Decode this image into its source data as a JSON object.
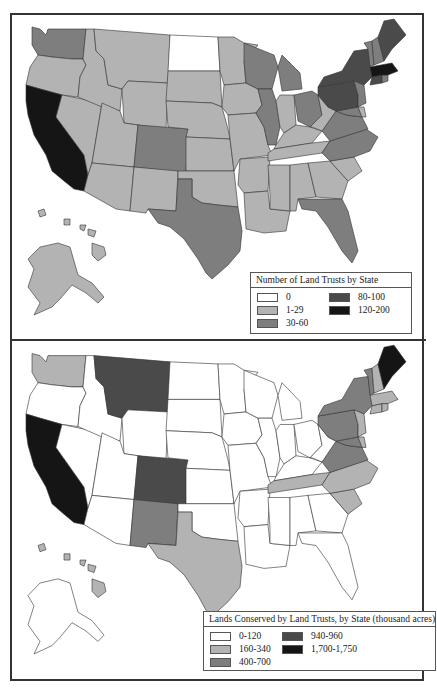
{
  "chart_data": [
    {
      "type": "choropleth",
      "title": "Number of Land Trusts by State",
      "legend_position": "lower-right",
      "classes": [
        {
          "key": "c0",
          "label": "0",
          "color": "#ffffff"
        },
        {
          "key": "c1",
          "label": "1-29",
          "color": "#b3b3b3"
        },
        {
          "key": "c2",
          "label": "30-60",
          "color": "#7e7e7e"
        },
        {
          "key": "c3",
          "label": "80-100",
          "color": "#4a4a4a"
        },
        {
          "key": "c4",
          "label": "120-200",
          "color": "#151515"
        }
      ],
      "states": {
        "WA": "c2",
        "OR": "c1",
        "CA": "c4",
        "NV": "c1",
        "ID": "c1",
        "MT": "c1",
        "WY": "c1",
        "UT": "c1",
        "AZ": "c1",
        "CO": "c2",
        "NM": "c1",
        "ND": "c0",
        "SD": "c1",
        "NE": "c1",
        "KS": "c1",
        "OK": "c1",
        "TX": "c2",
        "MN": "c1",
        "IA": "c1",
        "MO": "c1",
        "AR": "c1",
        "LA": "c1",
        "WI": "c2",
        "IL": "c2",
        "MI": "c2",
        "IN": "c1",
        "OH": "c2",
        "KY": "c1",
        "TN": "c1",
        "MS": "c1",
        "AL": "c1",
        "GA": "c1",
        "FL": "c2",
        "SC": "c1",
        "NC": "c2",
        "VA": "c2",
        "WV": "c1",
        "MD": "c2",
        "DE": "c1",
        "PA": "c3",
        "NY": "c3",
        "NJ": "c2",
        "CT": "c3",
        "RI": "c2",
        "MA": "c4",
        "VT": "c2",
        "NH": "c2",
        "ME": "c3",
        "AK": "c1",
        "HI": "c1"
      }
    },
    {
      "type": "choropleth",
      "title": "Lands Conserved by Land Trusts, by State (thousand acres)",
      "legend_position": "lower-right",
      "classes": [
        {
          "key": "c0",
          "label": "0-120",
          "color": "#ffffff"
        },
        {
          "key": "c1",
          "label": "160-340",
          "color": "#b3b3b3"
        },
        {
          "key": "c2",
          "label": "400-700",
          "color": "#7e7e7e"
        },
        {
          "key": "c3",
          "label": "940-960",
          "color": "#4a4a4a"
        },
        {
          "key": "c4",
          "label": "1,700-1,750",
          "color": "#151515"
        }
      ],
      "states": {
        "WA": "c1",
        "OR": "c0",
        "CA": "c4",
        "NV": "c0",
        "ID": "c0",
        "MT": "c3",
        "WY": "c0",
        "UT": "c0",
        "AZ": "c0",
        "CO": "c3",
        "NM": "c2",
        "ND": "c0",
        "SD": "c0",
        "NE": "c0",
        "KS": "c0",
        "OK": "c0",
        "TX": "c1",
        "MN": "c0",
        "IA": "c0",
        "MO": "c0",
        "AR": "c0",
        "LA": "c0",
        "WI": "c0",
        "IL": "c0",
        "MI": "c0",
        "IN": "c0",
        "OH": "c0",
        "KY": "c0",
        "TN": "c1",
        "MS": "c0",
        "AL": "c0",
        "GA": "c0",
        "FL": "c0",
        "SC": "c1",
        "NC": "c1",
        "VA": "c2",
        "WV": "c0",
        "MD": "c2",
        "DE": "c1",
        "PA": "c2",
        "NY": "c2",
        "NJ": "c1",
        "CT": "c1",
        "RI": "c1",
        "MA": "c1",
        "VT": "c2",
        "NH": "c1",
        "ME": "c4",
        "AK": "c0",
        "HI": "c1"
      }
    }
  ],
  "maps": [
    {
      "legend_title": "Number of Land Trusts by State",
      "legend_items": [
        {
          "label": "0",
          "color": "#ffffff"
        },
        {
          "label": "1-29",
          "color": "#b3b3b3"
        },
        {
          "label": "30-60",
          "color": "#7e7e7e"
        },
        {
          "label": "80-100",
          "color": "#4a4a4a"
        },
        {
          "label": "120-200",
          "color": "#151515"
        }
      ]
    },
    {
      "legend_title": "Lands Conserved by Land Trusts, by State (thousand acres)",
      "legend_items": [
        {
          "label": "0-120",
          "color": "#ffffff"
        },
        {
          "label": "160-340",
          "color": "#b3b3b3"
        },
        {
          "label": "400-700",
          "color": "#7e7e7e"
        },
        {
          "label": "940-960",
          "color": "#4a4a4a"
        },
        {
          "label": "1,700-1,750",
          "color": "#151515"
        }
      ]
    }
  ]
}
